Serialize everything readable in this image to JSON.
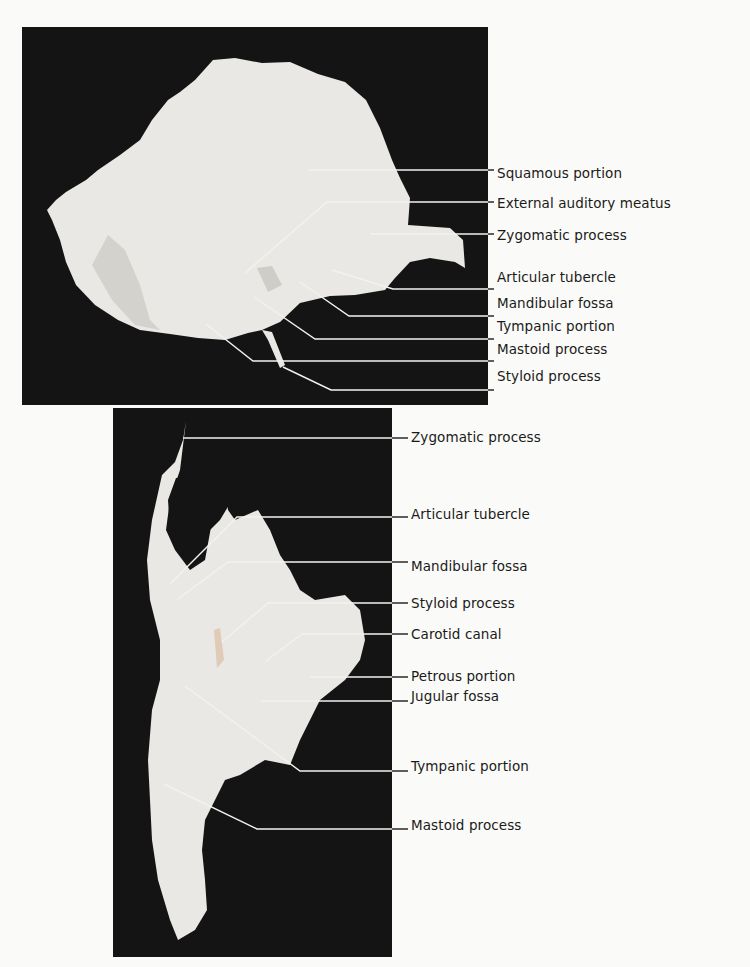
{
  "figure": {
    "top_view": {
      "name": "temporal-bone-lateral-view",
      "labels": [
        {
          "id": "squamous-portion",
          "text": "Squamous portion",
          "x": 497,
          "y": 173,
          "point": [
            308,
            170
          ],
          "elbow": null
        },
        {
          "id": "external-auditory-meatus",
          "text": "External auditory meatus",
          "x": 497,
          "y": 203,
          "point": [
            245,
            273
          ],
          "elbow": [
            327,
            202
          ]
        },
        {
          "id": "zygomatic-process",
          "text": "Zygomatic process",
          "x": 497,
          "y": 235,
          "point": [
            370,
            234
          ],
          "elbow": null
        },
        {
          "id": "articular-tubercle",
          "text": "Articular tubercle",
          "x": 497,
          "y": 277,
          "point": [
            332,
            270
          ],
          "elbow": [
            393,
            289
          ]
        },
        {
          "id": "mandibular-fossa",
          "text": "Mandibular fossa",
          "x": 497,
          "y": 303,
          "point": [
            300,
            282
          ],
          "elbow": [
            349,
            316
          ]
        },
        {
          "id": "tympanic-portion",
          "text": "Tympanic portion",
          "x": 497,
          "y": 326,
          "point": [
            254,
            297
          ],
          "elbow": [
            315,
            339
          ]
        },
        {
          "id": "mastoid-process",
          "text": "Mastoid process",
          "x": 497,
          "y": 349,
          "point": [
            206,
            324
          ],
          "elbow": [
            253,
            361
          ]
        },
        {
          "id": "styloid-process",
          "text": "Styloid process",
          "x": 497,
          "y": 376,
          "point": [
            283,
            367
          ],
          "elbow": [
            331,
            390
          ]
        }
      ]
    },
    "bottom_view": {
      "name": "temporal-bone-inferior-view",
      "labels": [
        {
          "id": "zygomatic-process-2",
          "text": "Zygomatic process",
          "x": 411,
          "y": 437,
          "point": [
            183,
            438
          ],
          "elbow": null
        },
        {
          "id": "articular-tubercle-2",
          "text": "Articular tubercle",
          "x": 411,
          "y": 514,
          "point": [
            170,
            584
          ],
          "elbow": [
            237,
            517
          ]
        },
        {
          "id": "mandibular-fossa-2",
          "text": "Mandibular fossa",
          "x": 411,
          "y": 566,
          "point": [
            178,
            599
          ],
          "elbow": [
            228,
            562
          ]
        },
        {
          "id": "styloid-process-2",
          "text": "Styloid process",
          "x": 411,
          "y": 603,
          "point": [
            222,
            642
          ],
          "elbow": [
            268,
            603
          ]
        },
        {
          "id": "carotid-canal",
          "text": "Carotid canal",
          "x": 411,
          "y": 634,
          "point": [
            266,
            661
          ],
          "elbow": [
            302,
            634
          ]
        },
        {
          "id": "petrous-portion",
          "text": "Petrous portion",
          "x": 411,
          "y": 676,
          "point": [
            310,
            677
          ],
          "elbow": null
        },
        {
          "id": "jugular-fossa",
          "text": "Jugular fossa",
          "x": 411,
          "y": 696,
          "point": [
            261,
            701
          ],
          "elbow": null
        },
        {
          "id": "tympanic-portion-2",
          "text": "Tympanic portion",
          "x": 411,
          "y": 766,
          "point": [
            185,
            686
          ],
          "elbow": [
            300,
            771
          ]
        },
        {
          "id": "mastoid-process-2",
          "text": "Mastoid process",
          "x": 411,
          "y": 825,
          "point": [
            164,
            784
          ],
          "elbow": [
            257,
            829
          ]
        }
      ]
    }
  },
  "colors": {
    "background": "#fafaf8",
    "photo_background": "#141414",
    "bone": "#e9e8e4",
    "text": "#1a1a1a"
  }
}
